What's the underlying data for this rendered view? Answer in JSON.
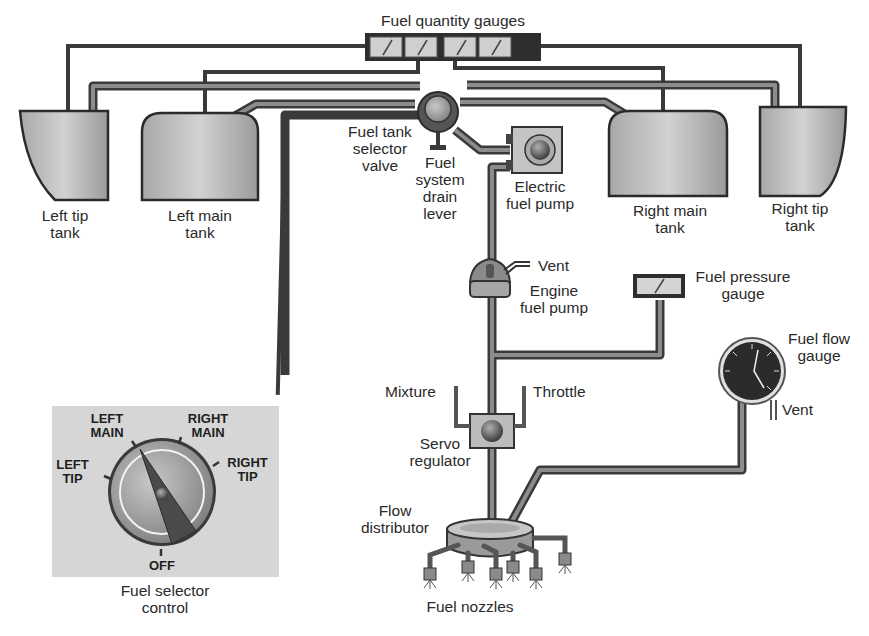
{
  "diagram": {
    "title": "Fuel quantity gauges",
    "components": {
      "fuel_quantity_gauges": "Fuel quantity gauges",
      "left_tip_tank": "Left tip\ntank",
      "left_main_tank": "Left main\ntank",
      "right_main_tank": "Right main\ntank",
      "right_tip_tank": "Right tip\ntank",
      "selector_valve": "Fuel tank\nselector\nvalve",
      "drain_lever": "Fuel\nsystem\ndrain\nlever",
      "electric_pump": "Electric\nfuel pump",
      "vent_engine_pump": "Vent",
      "engine_pump": "Engine\nfuel pump",
      "fuel_pressure_gauge": "Fuel pressure\ngauge",
      "fuel_flow_gauge": "Fuel flow\ngauge",
      "vent_flow_gauge": "Vent",
      "mixture": "Mixture",
      "throttle": "Throttle",
      "servo_regulator": "Servo\nregulator",
      "flow_distributor": "Flow\ndistributor",
      "fuel_nozzles": "Fuel nozzles",
      "fuel_selector_control": "Fuel selector\ncontrol"
    },
    "selector_positions": {
      "left_main": "LEFT\nMAIN",
      "right_main": "RIGHT\nMAIN",
      "left_tip": "LEFT\nTIP",
      "right_tip": "RIGHT\nTIP",
      "off": "OFF"
    },
    "colors": {
      "pipe_outline": "#3a3a3a",
      "pipe_fill": "#8a8a8a",
      "tank_fill": "#b8b8b8",
      "panel_bg": "#d6d6d6",
      "text": "#2a2a2a"
    }
  }
}
